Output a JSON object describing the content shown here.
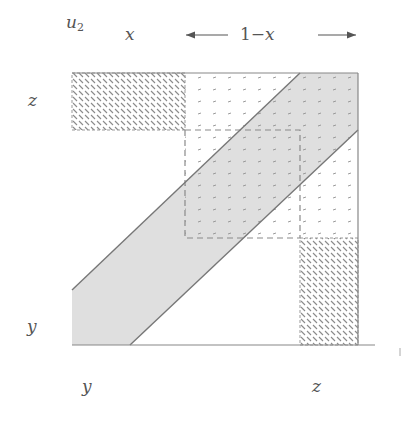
{
  "labels": {
    "u": "u",
    "u_sub": "2",
    "x_top": "x",
    "one_minus": "1−",
    "one_minus_x_var": "x",
    "z_left": "z",
    "y_left": "y",
    "y_bottom": "y",
    "z_bottom": "z"
  },
  "figure": {
    "box": {
      "left": 72,
      "top": 73,
      "right": 358,
      "bottom": 345
    },
    "axis_line_end_x": 375,
    "upper_left_hatch": {
      "left": 72,
      "top": 73,
      "right": 185,
      "bottom": 130
    },
    "lower_right_hatch": {
      "left": 300,
      "top": 238,
      "right": 358,
      "bottom": 345
    },
    "stipple_region": {
      "left": 185,
      "top": 73,
      "right": 358,
      "bottom": 238
    },
    "dashed_rect": {
      "left": 185,
      "top": 130,
      "right": 300,
      "bottom": 238
    },
    "band": {
      "upper_line": [
        [
          72,
          290
        ],
        [
          300,
          73
        ]
      ],
      "lower_line": [
        [
          130,
          345
        ],
        [
          358,
          130
        ]
      ]
    },
    "colors": {
      "band_fill": "#dcdcdc",
      "line": "#777777",
      "hatch": "#8a8a8a",
      "stipple": "#9a9a9a"
    }
  },
  "arrows": {
    "left_arrow": "←",
    "right_arrow": "→"
  }
}
